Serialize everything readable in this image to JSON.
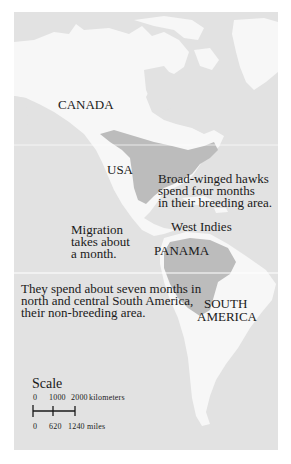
{
  "map": {
    "colors": {
      "ocean": "#e2e2e2",
      "land": "#f7f7f7",
      "range": "#bcbcbc",
      "text": "#1a1a1a"
    },
    "labels": {
      "canada": "CANADA",
      "usa": "USA",
      "west_indies": "West Indies",
      "panama": "PANAMA",
      "south_1": "SOUTH",
      "south_2": "AMERICA"
    },
    "notes": {
      "breeding": [
        "Broad-winged hawks",
        "spend four months",
        "in their breeding area."
      ],
      "migration": [
        "Migration",
        "takes about",
        "a month."
      ],
      "nonbreeding": [
        "They spend about seven months in",
        "north and central South America,",
        "their non-breeding area."
      ]
    },
    "scale": {
      "title": "Scale",
      "km_ticks": [
        "0",
        "1000",
        "2000"
      ],
      "km_unit": "kilometers",
      "mile_ticks": [
        "0",
        "620",
        "1240"
      ],
      "mile_unit": "miles"
    }
  }
}
